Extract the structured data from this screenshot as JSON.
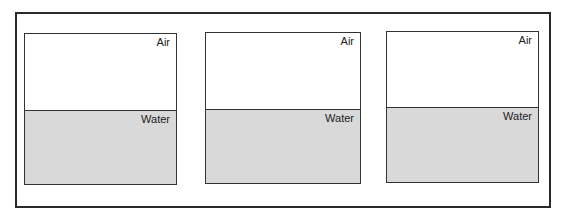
{
  "diagram": {
    "title": "",
    "panels": [
      {
        "top_label": "Air",
        "bottom_label": "Water"
      },
      {
        "top_label": "Air",
        "bottom_label": "Water"
      },
      {
        "top_label": "Air",
        "bottom_label": "Water"
      }
    ],
    "colors": {
      "water": "#d9d9d9",
      "air": "#ffffff",
      "border": "#333333"
    }
  }
}
